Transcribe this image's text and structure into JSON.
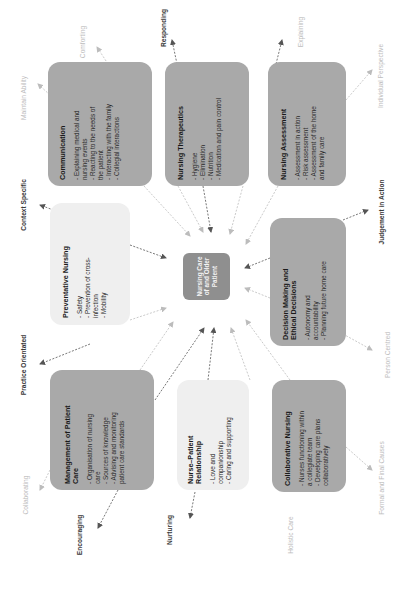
{
  "diagram": {
    "orientation": "rotated 90 degrees counter-clockwise",
    "colors": {
      "box_dark": "#a9a9a9",
      "box_light": "#efefef",
      "center": "#8f8f8f",
      "label_dark": "#3a3a3a",
      "label_light": "#bdbdbd"
    },
    "center": {
      "lines": [
        "Nursing Care",
        "of and Older",
        "Patient"
      ]
    },
    "boxes": {
      "communication": {
        "title": "Communication",
        "items": [
          "- Explaining medical and",
          "nursing events",
          "- Reacting to the needs of",
          "the patient",
          "- Interacting with the family",
          "- Collegial interactions"
        ]
      },
      "therapeutics": {
        "title": "Nursing Therapeutics",
        "items": [
          "- Hygiene",
          "- Elimination",
          "- Nutrition",
          "- Medication and pain control"
        ]
      },
      "assessment": {
        "title": "Nursing Assessment",
        "items": [
          "- Assessment in action",
          "- Risk assessment",
          "- Assessment of the home",
          "and family care"
        ]
      },
      "preventative": {
        "title": "Preventative Nursing",
        "items": [
          "- Safety",
          "- Prevention of cross-",
          "infection",
          "- Mobility"
        ]
      },
      "decision": {
        "title_lines": [
          "Decision Making and",
          "Ethical Decisions"
        ],
        "items": [
          "- Autonomy and",
          "accountability",
          "- Planning future home care"
        ]
      },
      "management": {
        "title_lines": [
          "Management of Patient",
          "Care"
        ],
        "items": [
          "- Organisation of nursing",
          "care",
          "- Sources of knowledge",
          "- Advising and monitoring",
          "patient care standards"
        ]
      },
      "relationship": {
        "title_lines": [
          "Nurse–Patient",
          "Relationship"
        ],
        "items": [
          "- Love and",
          "companionship",
          "- Caring and supporting"
        ]
      },
      "collaborative": {
        "title": "Collaborative Nursing",
        "items": [
          "- Nurses functioning within",
          "a collegiate team",
          "- Developing care plans",
          "collaboratively"
        ]
      }
    },
    "labels": {
      "maintain_ability": "Maintain Ability",
      "comforting": "Comforting",
      "responding": "Responding",
      "explaining": "Explaining",
      "individual_perspective": "Individual Perspective",
      "context_specific": "Context Specific",
      "judgement_in_action": "Judgement in Action",
      "practice_orientated": "Practice Orientated",
      "person_centred": "Person Centred",
      "collaborating": "Collaborating",
      "encouraging": "Encouraging",
      "nurturing": "Nurturing",
      "holistic_care": "Holistic Care",
      "formal_and_final_causes": "Formal and Final Causes"
    }
  }
}
